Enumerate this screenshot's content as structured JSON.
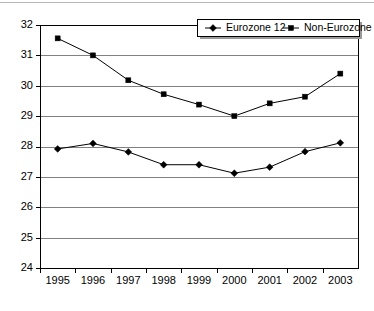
{
  "chart_data": {
    "type": "line",
    "title": "",
    "xlabel": "",
    "ylabel": "",
    "x": [
      1995,
      1996,
      1997,
      1998,
      1999,
      2000,
      2001,
      2002,
      2003
    ],
    "categories": [
      "1995",
      "1996",
      "1997",
      "1998",
      "1999",
      "2000",
      "2001",
      "2002",
      "2003"
    ],
    "ylim": [
      24,
      32
    ],
    "yticks": [
      24,
      25,
      26,
      27,
      28,
      29,
      30,
      31,
      32
    ],
    "ytick_labels": [
      "24",
      "25",
      "26",
      "27",
      "28",
      "29",
      "30",
      "31",
      "32"
    ],
    "grid": "horizontal",
    "legend_position": "top-right",
    "series": [
      {
        "name": "Eurozone 12",
        "marker": "diamond",
        "color": "#000000",
        "values": [
          27.92,
          28.1,
          27.82,
          27.4,
          27.4,
          27.12,
          27.32,
          27.83,
          28.12
        ]
      },
      {
        "name": "Non-Eurozone",
        "marker": "square",
        "color": "#000000",
        "values": [
          31.56,
          31.0,
          30.18,
          29.72,
          29.38,
          29.0,
          29.42,
          29.64,
          30.4
        ]
      }
    ]
  },
  "legend": {
    "entries": [
      {
        "label": "Eurozone 12",
        "marker": "diamond"
      },
      {
        "label": "Non-Eurozone",
        "marker": "square"
      }
    ]
  }
}
